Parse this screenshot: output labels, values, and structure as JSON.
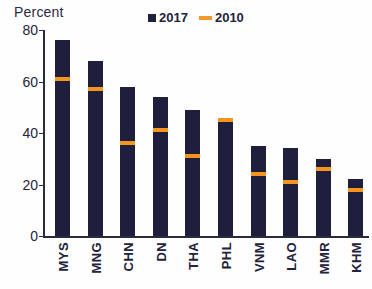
{
  "chart_data": {
    "type": "bar",
    "title": "",
    "subtitle": "",
    "ylabel": "Percent",
    "xlabel": "",
    "ylim": [
      0,
      80
    ],
    "yticks": [
      0,
      20,
      40,
      60,
      80
    ],
    "grid": false,
    "legend_position": "top-center",
    "categories": [
      "MYS",
      "MNG",
      "CHN",
      "DN",
      "THA",
      "PHL",
      "VNM",
      "LAO",
      "MMR",
      "KHM"
    ],
    "series": [
      {
        "name": "2017",
        "type": "bar",
        "color": "#1f1f3d",
        "values": [
          76,
          68,
          58,
          54,
          49,
          46,
          35,
          34,
          30,
          22
        ]
      },
      {
        "name": "2010",
        "type": "marker",
        "color": "#f5941f",
        "values": [
          61,
          57,
          36,
          41,
          31,
          45,
          24,
          21,
          26,
          18
        ]
      }
    ]
  },
  "axis": {
    "y_title": "Percent",
    "tick_labels": [
      "80",
      "60",
      "40",
      "20",
      "0"
    ]
  },
  "legend": {
    "items": [
      {
        "label": "2017",
        "marker": "filled-square",
        "color": "#1f1f3d"
      },
      {
        "label": "2010",
        "marker": "dash",
        "color": "#f5941f"
      }
    ]
  }
}
